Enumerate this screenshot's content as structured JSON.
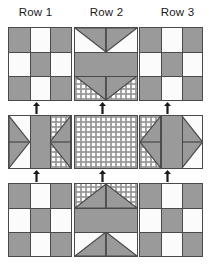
{
  "headers": [
    {
      "label": "Row 1"
    },
    {
      "label": "Row 2"
    },
    {
      "label": "Row 3"
    }
  ],
  "colors": {
    "fabric_dark": "#9a9a9a",
    "fabric_light": "#fbfbfb",
    "fabric_check": "#fdfdfd",
    "seam_line": "#4a4a4a",
    "text": "#1a1a1a",
    "caption_text": "#8d8d8d",
    "background": "#ffffff"
  },
  "diagram": {
    "kind": "quilt-block-assembly",
    "bands": [
      {
        "name": "top-band",
        "blocks": [
          {
            "name": "row1-top-block",
            "pattern": "nine-patch",
            "patches": [
              "dark",
              "light",
              "dark",
              "light",
              "dark",
              "light",
              "dark",
              "light",
              "dark"
            ]
          },
          {
            "name": "row2-top-block",
            "pattern": "flying-geese-down",
            "patches": [
              "geese-down-light",
              "solid-dark",
              "geese-down-check"
            ]
          },
          {
            "name": "row3-top-block",
            "pattern": "nine-patch",
            "patches": [
              "dark",
              "light",
              "dark",
              "light",
              "dark",
              "light",
              "dark",
              "light",
              "dark"
            ]
          }
        ]
      },
      {
        "name": "middle-band",
        "blocks": [
          {
            "name": "row1-middle-block",
            "pattern": "side-triangles",
            "patches": [
              "triangle-right-on-light",
              "solid-dark",
              "triangle-left-on-check"
            ]
          },
          {
            "name": "row2-middle-block",
            "pattern": "solid-check",
            "patches": [
              "check"
            ]
          },
          {
            "name": "row3-middle-block",
            "pattern": "side-triangles-mirrored",
            "patches": [
              "triangle-left-on-check",
              "solid-dark",
              "triangle-right-on-light"
            ]
          }
        ]
      },
      {
        "name": "bottom-band",
        "blocks": [
          {
            "name": "row1-bottom-block",
            "pattern": "nine-patch",
            "patches": [
              "dark",
              "light",
              "dark",
              "light",
              "dark",
              "light",
              "dark",
              "light",
              "dark"
            ]
          },
          {
            "name": "row2-bottom-block",
            "pattern": "flying-geese-up",
            "patches": [
              "geese-up-check",
              "solid-dark",
              "geese-up-light"
            ]
          },
          {
            "name": "row3-bottom-block",
            "pattern": "nine-patch",
            "patches": [
              "dark",
              "light",
              "dark",
              "light",
              "dark",
              "light",
              "dark",
              "light",
              "dark"
            ]
          }
        ]
      }
    ],
    "arrow_rows": [
      {
        "name": "arrows-upper",
        "direction": "up",
        "count": 3
      },
      {
        "name": "arrows-lower",
        "direction": "up",
        "count": 3
      }
    ]
  },
  "caption": {
    "text": ""
  }
}
